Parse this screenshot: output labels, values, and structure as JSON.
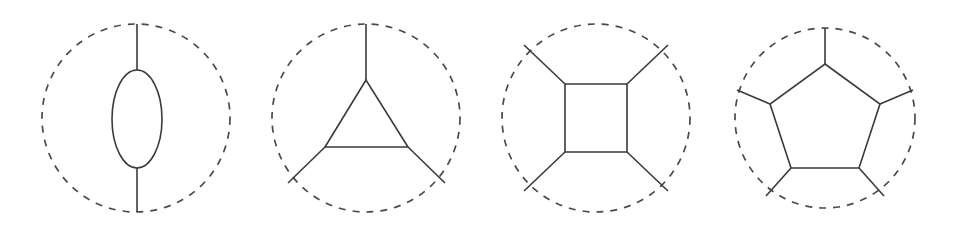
{
  "figure": {
    "background_color": "#ffffff",
    "stroke_color": "#3a3a3a",
    "solid_stroke_color": "#3a3a3a",
    "dashed_stroke_color": "#4a4a4a",
    "solid_stroke_width": 1.6,
    "dashed_stroke_width": 1.7,
    "dash_pattern": "7 7",
    "width": 953,
    "height": 230
  },
  "diagrams": [
    {
      "id": "bubble",
      "name": "bubble-diagram",
      "loop_order": 2,
      "label": "Bubble (2-point)",
      "circle": {
        "cx": 136,
        "cy": 118,
        "r": 94
      },
      "loop_shape": "ellipse",
      "ellipse": {
        "cx": 137,
        "cy": 119,
        "rx": 25,
        "ry": 49
      },
      "legs": [
        {
          "x1": 137,
          "y1": 24,
          "x2": 137,
          "y2": 70
        },
        {
          "x1": 137,
          "y1": 168,
          "x2": 137,
          "y2": 212
        }
      ],
      "vertices": [
        {
          "x": 137,
          "y": 70
        },
        {
          "x": 137,
          "y": 168
        }
      ]
    },
    {
      "id": "triangle",
      "name": "triangle-diagram",
      "loop_order": 3,
      "label": "Triangle (3-point)",
      "circle": {
        "cx": 366,
        "cy": 118,
        "r": 94
      },
      "loop_shape": "polygon",
      "polygon_points": "366,80 325,147 408,147",
      "legs": [
        {
          "x1": 366,
          "y1": 80,
          "x2": 366,
          "y2": 24
        },
        {
          "x1": 325,
          "y1": 147,
          "x2": 288,
          "y2": 183
        },
        {
          "x1": 408,
          "y1": 147,
          "x2": 445,
          "y2": 183
        }
      ],
      "vertices": [
        {
          "x": 366,
          "y": 80
        },
        {
          "x": 325,
          "y": 147
        },
        {
          "x": 408,
          "y": 147
        }
      ]
    },
    {
      "id": "box",
      "name": "box-diagram",
      "loop_order": 4,
      "label": "Box (4-point)",
      "circle": {
        "cx": 596,
        "cy": 118,
        "r": 94
      },
      "loop_shape": "polygon",
      "polygon_points": "565,84 627,84 627,152 565,152",
      "legs": [
        {
          "x1": 565,
          "y1": 84,
          "x2": 524,
          "y2": 45
        },
        {
          "x1": 627,
          "y1": 84,
          "x2": 668,
          "y2": 45
        },
        {
          "x1": 627,
          "y1": 152,
          "x2": 668,
          "y2": 191
        },
        {
          "x1": 565,
          "y1": 152,
          "x2": 524,
          "y2": 191
        }
      ],
      "vertices": [
        {
          "x": 565,
          "y": 84
        },
        {
          "x": 627,
          "y": 84
        },
        {
          "x": 627,
          "y": 152
        },
        {
          "x": 565,
          "y": 152
        }
      ]
    },
    {
      "id": "pentagon",
      "name": "pentagon-diagram",
      "loop_order": 5,
      "label": "Pentagon (5-point)",
      "circle": {
        "cx": 825,
        "cy": 118,
        "r": 90
      },
      "loop_shape": "polygon",
      "polygon_points": "825,64 880,104 859,168 791,168 770,104",
      "legs": [
        {
          "x1": 825,
          "y1": 64,
          "x2": 825,
          "y2": 28
        },
        {
          "x1": 880,
          "y1": 104,
          "x2": 913,
          "y2": 90
        },
        {
          "x1": 859,
          "y1": 168,
          "x2": 884,
          "y2": 196
        },
        {
          "x1": 791,
          "y1": 168,
          "x2": 766,
          "y2": 196
        },
        {
          "x1": 770,
          "y1": 104,
          "x2": 737,
          "y2": 90
        }
      ],
      "vertices": [
        {
          "x": 825,
          "y": 64
        },
        {
          "x": 880,
          "y": 104
        },
        {
          "x": 859,
          "y": 168
        },
        {
          "x": 791,
          "y": 168
        },
        {
          "x": 770,
          "y": 104
        }
      ]
    }
  ]
}
